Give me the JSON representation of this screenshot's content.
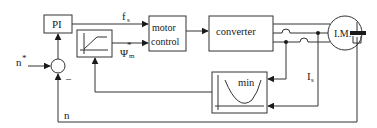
{
  "diagram": {
    "type": "block-diagram",
    "blocks": {
      "pi": {
        "label": "PI"
      },
      "motor_control": {
        "line1": "motor",
        "line2": "control"
      },
      "converter": {
        "label": "converter"
      },
      "motor": {
        "label": "I.M."
      },
      "min_block": {
        "label": "min"
      },
      "ramp": {
        "label": ""
      }
    },
    "signals": {
      "speed_ref": {
        "label": "n",
        "superscript": "*"
      },
      "freq": {
        "label": "f",
        "subscript": "s"
      },
      "flux_ref": {
        "label": "Ψ",
        "superscript": "*",
        "subscript": "m"
      },
      "current": {
        "label": "I",
        "subscript": "s"
      },
      "speed_feedback": {
        "label": "n"
      },
      "minus_sign": "–"
    },
    "colors": {
      "line": "#333333",
      "background": "#ffffff"
    }
  }
}
